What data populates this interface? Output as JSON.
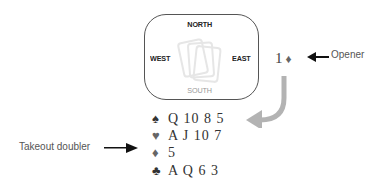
{
  "compass": {
    "north": "NORTH",
    "south": "SOUTH",
    "east": "EAST",
    "west": "WEST"
  },
  "bid": {
    "level": "1",
    "suit_symbol": "♦",
    "annotation": "Opener"
  },
  "hand": {
    "annotation": "Takeout doubler",
    "suits": [
      {
        "name": "spades",
        "symbol": "♠",
        "cards": "Q 10 8 5"
      },
      {
        "name": "hearts",
        "symbol": "♥",
        "cards": "A J 10 7"
      },
      {
        "name": "diamonds",
        "symbol": "♦",
        "cards": "5"
      },
      {
        "name": "clubs",
        "symbol": "♣",
        "cards": "A Q 6 3"
      }
    ]
  },
  "colors": {
    "border": "#555555",
    "arrow_curved": "#b3b3b3",
    "arrow_pointer": "#111111",
    "text": "#333333"
  }
}
